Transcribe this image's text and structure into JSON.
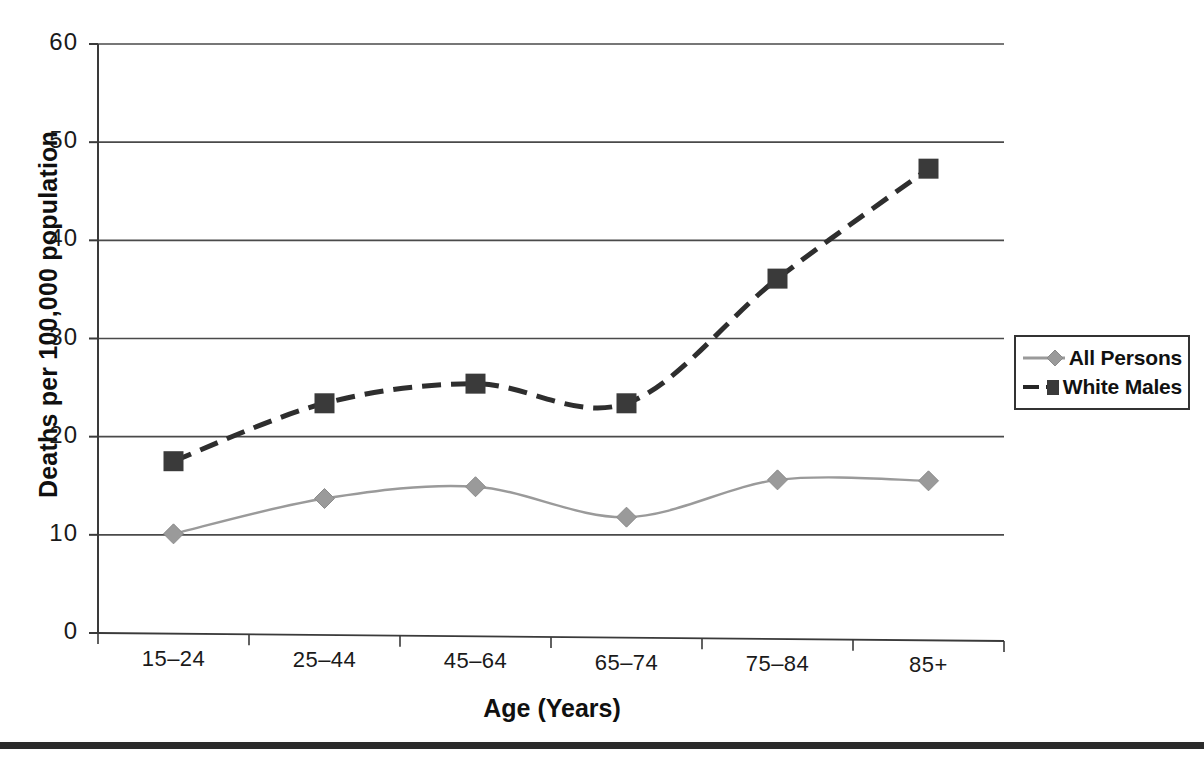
{
  "chart_data": {
    "type": "line",
    "title": "",
    "xlabel": "Age (Years)",
    "ylabel": "Deaths per 100,000 population",
    "categories": [
      "15–24",
      "25–44",
      "45–64",
      "65–74",
      "75–84",
      "85+"
    ],
    "ylim": [
      0,
      60
    ],
    "yticks": [
      0,
      10,
      20,
      30,
      40,
      50,
      60
    ],
    "ytick_labels": [
      "0",
      "10",
      "20",
      "30",
      "40",
      "50",
      "60"
    ],
    "grid": "horizontal",
    "legend_position": "right",
    "series": [
      {
        "name": "All Persons",
        "values": [
          10.1,
          13.7,
          14.9,
          11.8,
          15.6,
          15.5
        ],
        "color": "#8c8c8c",
        "marker": "diamond",
        "line_style": "solid"
      },
      {
        "name": "White Males",
        "values": [
          17.5,
          23.4,
          25.4,
          23.4,
          36.1,
          47.3
        ],
        "color": "#3d3d3d",
        "marker": "square",
        "line_style": "dashed"
      }
    ]
  },
  "legend": {
    "entries": [
      {
        "label": "All Persons"
      },
      {
        "label": "White Males"
      }
    ]
  },
  "axes": {
    "y_title": "Deaths per 100,000 population",
    "x_title": "Age (Years)"
  }
}
